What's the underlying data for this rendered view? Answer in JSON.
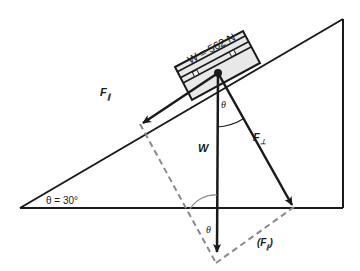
{
  "diagram": {
    "block_label": "W = 562 N",
    "labels": {
      "f_parallel": "F",
      "f_parallel_sub": "∥",
      "f_perp": "F",
      "f_perp_sub": "⊥",
      "weight": "W",
      "theta_top": "θ",
      "theta_bottom": "θ",
      "incline_angle": "θ = 30°",
      "f_parallel_paren_open": "(F",
      "f_parallel_paren_sub": "∥",
      "f_parallel_paren_close": ")"
    },
    "values": {
      "weight_N": 562,
      "incline_angle_deg": 30
    },
    "colors": {
      "line": "#1a1a1a",
      "dashed": "#8a8a8a",
      "block_fill": "#e8e8e8"
    }
  }
}
